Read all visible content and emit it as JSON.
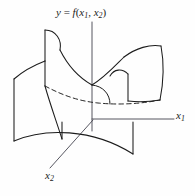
{
  "figure": {
    "kind": "3d-surface-sketch",
    "background_color": "#fefefe",
    "line_color": "#1c1c1c",
    "axis_color": "#3a3a4a",
    "labels": {
      "function": {
        "y": "y",
        "equals": "=",
        "f": "f",
        "open": "(",
        "x": "x",
        "sub1": "1",
        "comma": ",",
        "x_b": "x",
        "sub2": "2",
        "close": ")",
        "full_text": "y = f(x1, x2)"
      },
      "x1_axis": {
        "base": "x",
        "sub": "1",
        "full_text": "x1"
      },
      "x2_axis": {
        "base": "x",
        "sub": "2",
        "full_text": "x2"
      }
    },
    "axes": [
      {
        "name": "y-axis",
        "orientation": "vertical",
        "from": [
          92,
          22
        ],
        "to": [
          92,
          131
        ]
      },
      {
        "name": "x1-axis",
        "orientation": "horizontal-right",
        "from": [
          92,
          119
        ],
        "to": [
          174,
          119
        ]
      },
      {
        "name": "x2-axis",
        "orientation": "diagonal-down-left",
        "from": [
          92,
          119
        ],
        "to": [
          49,
          168
        ]
      }
    ],
    "surface": {
      "type": "saddle",
      "visible_edges": [
        "left-vertical",
        "right-quadrilateral",
        "bottom-convex-arc",
        "top-ridges"
      ],
      "hidden_edge_style": "dashed",
      "hidden_edge_name": "rear-contour"
    }
  }
}
